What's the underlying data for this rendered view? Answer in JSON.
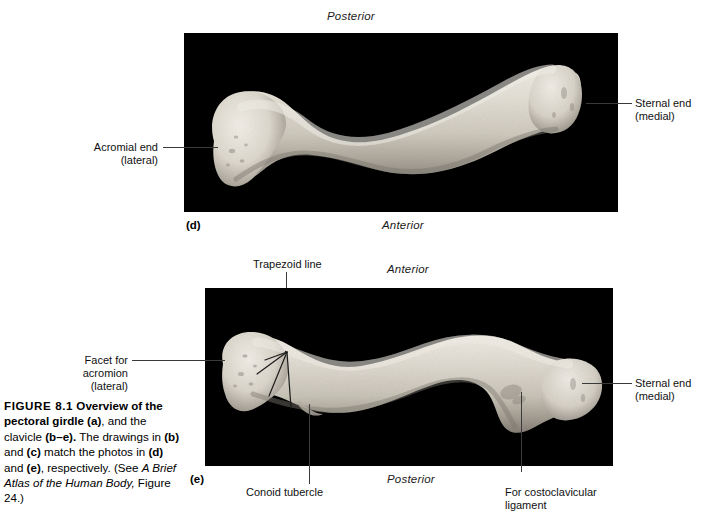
{
  "figure": {
    "number": "FIGURE 8.1",
    "caption_lead": "FIGURE 8.1 Overview of the pectoral girdle (a),",
    "caption_parts": {
      "p1": "FIGURE 8.1",
      "p2": " Overview of the pectoral girdle ",
      "p3": "(a)",
      "p4": ", and the clavicle ",
      "p5": "(b–e).",
      "p6": " The drawings in ",
      "p7": "(b)",
      "p8": " and ",
      "p9": "(c)",
      "p10": " match the photos in ",
      "p11": "(d)",
      "p12": " and ",
      "p13": "(e)",
      "p14": ", respectively. (See ",
      "p15": "A Brief Atlas of the Human Body,",
      "p16": " Figure 24.)"
    }
  },
  "panel_d": {
    "letter": "(d)",
    "orientation_top": "Posterior",
    "orientation_bottom": "Anterior",
    "labels": {
      "left": {
        "line1": "Acromial end",
        "line2": "(lateral)"
      },
      "right": {
        "line1": "Sternal end",
        "line2": "(medial)"
      }
    }
  },
  "panel_e": {
    "letter": "(e)",
    "orientation_top": "Anterior",
    "orientation_bottom": "Posterior",
    "labels": {
      "trapezoid": "Trapezoid line",
      "facet": {
        "line1": "Facet for",
        "line2": "acromion",
        "line3": "(lateral)"
      },
      "sternal": {
        "line1": "Sternal end",
        "line2": "(medial)"
      },
      "conoid": "Conoid tubercle",
      "costoclavicular": {
        "line1": "For costoclavicular",
        "line2": "ligament"
      }
    }
  },
  "colors": {
    "panel_background": "#000000",
    "bone_light": "#e6e2d9",
    "bone_mid": "#cdc8bd",
    "bone_shadow": "#8d887e",
    "leader_line": "#3a3a3a",
    "page_background": "#ffffff"
  }
}
